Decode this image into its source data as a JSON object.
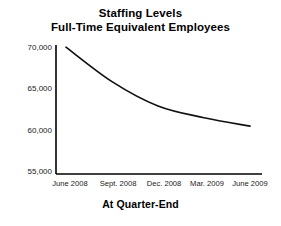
{
  "chart_data": {
    "type": "line",
    "title": "Staffing Levels",
    "subtitle": "Full-Time Equivalent Employees",
    "xlabel": "At Quarter-End",
    "ylabel": "",
    "categories": [
      "June 2008",
      "Sept. 2008",
      "Dec. 2008",
      "Mar. 2009",
      "June 2009"
    ],
    "values": [
      70100,
      66000,
      63100,
      61700,
      60700
    ],
    "series": [
      {
        "name": "Full-Time Equivalent Employees",
        "values": [
          70100,
          66000,
          63100,
          61700,
          60700
        ]
      }
    ],
    "ylim": [
      55000,
      71500
    ],
    "yticks": [
      55000,
      60000,
      65000,
      70000
    ],
    "ytick_labels": [
      "55,000",
      "60,000",
      "65,000",
      "70,000"
    ],
    "grid": false,
    "legend": false,
    "legend_position": "none",
    "line_color": "#111111",
    "axis_color": "#000000",
    "background_color": "#ffffff"
  },
  "titles": {
    "line1": "Staffing Levels",
    "line2": "Full-Time Equivalent Employees"
  },
  "axis": {
    "x_title": "At Quarter-End",
    "y_ticks": [
      {
        "label": "70,000",
        "value": 70000
      },
      {
        "label": "65,000",
        "value": 65000
      },
      {
        "label": "60,000",
        "value": 60000
      },
      {
        "label": "55,000",
        "value": 55000
      }
    ],
    "x_ticks": [
      {
        "label": "June 2008"
      },
      {
        "label": "Sept. 2008"
      },
      {
        "label": "Dec. 2008"
      },
      {
        "label": "Mar. 2009"
      },
      {
        "label": "June 2009"
      }
    ]
  }
}
